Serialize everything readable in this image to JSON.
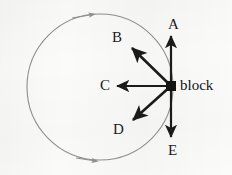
{
  "figure": {
    "type": "physics-free-body-diagram",
    "background_color": "#fbfbfa",
    "ink_color": "#1b1b1b",
    "path_color": "#8e8e8e"
  },
  "circle": {
    "name": "circular-path",
    "center_x": 100,
    "center_y": 87,
    "radius": 73,
    "stroke_color": "#8e8e8e",
    "stroke_width": 1.1,
    "direction": "clockwise",
    "direction_markers": [
      {
        "name": "top-direction-arrowhead",
        "angle_deg": -72,
        "points": "right"
      },
      {
        "name": "bottom-direction-arrowhead",
        "angle_deg": 72,
        "points": "right"
      }
    ]
  },
  "block": {
    "name": "block",
    "label": "block",
    "x": 171,
    "y": 86,
    "size": 10,
    "fill_color": "#141414",
    "label_x": 180,
    "label_y": 78
  },
  "vectors": [
    {
      "id": "A",
      "label": "A",
      "direction": "up",
      "angle_deg": 90,
      "tip_x": 171,
      "tip_y": 36,
      "label_x": 168,
      "label_y": 17
    },
    {
      "id": "B",
      "label": "B",
      "direction": "up-left",
      "angle_deg": 138,
      "tip_x": 132,
      "tip_y": 48,
      "label_x": 112,
      "label_y": 30
    },
    {
      "id": "C",
      "label": "C",
      "direction": "left",
      "angle_deg": 180,
      "tip_x": 117,
      "tip_y": 86,
      "label_x": 100,
      "label_y": 78
    },
    {
      "id": "D",
      "label": "D",
      "direction": "down-left",
      "angle_deg": 222,
      "tip_x": 133,
      "tip_y": 120,
      "label_x": 113,
      "label_y": 122
    },
    {
      "id": "E",
      "label": "E",
      "direction": "down",
      "angle_deg": 270,
      "tip_x": 171,
      "tip_y": 137,
      "label_x": 168,
      "label_y": 143
    }
  ]
}
